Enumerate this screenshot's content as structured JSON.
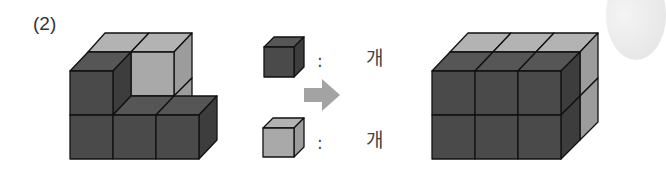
{
  "problem": {
    "number_label": "(2)"
  },
  "legend": {
    "items": [
      {
        "cube": "dark-cube",
        "separator": ":",
        "count": "",
        "unit": "개"
      },
      {
        "cube": "light-cube",
        "separator": ":",
        "count": "",
        "unit": "개"
      }
    ],
    "arrow": "right-arrow"
  },
  "figures": {
    "initial": {
      "description": "Partial stack: 5 dark cubes and 2 light cubes visible"
    },
    "target": {
      "description": "3x2x2 cuboid: dark front layer, light back layer"
    }
  },
  "colors": {
    "dark_front": "#4a4a4a",
    "dark_top": "#565656",
    "dark_side": "#3d3d3d",
    "light_front": "#a9a9a9",
    "light_top": "#b3b3b3",
    "light_side": "#9c9c9c",
    "arrow": "#a3a3a3",
    "stroke": "#111111"
  }
}
